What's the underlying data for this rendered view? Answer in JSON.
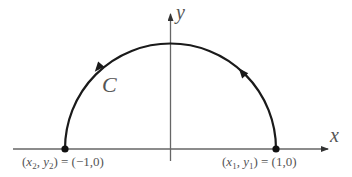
{
  "diagram": {
    "axes": {
      "x_label": "x",
      "y_label": "y"
    },
    "curve": {
      "label": "C",
      "type": "upper semicircle",
      "direction": "counterclockwise"
    },
    "points": [
      {
        "name": "(x1, y1)",
        "label_lhs_var1": "x",
        "label_lhs_sub1": "1",
        "label_lhs_var2": "y",
        "label_lhs_sub2": "1",
        "value": "= (1,0)"
      },
      {
        "name": "(x2, y2)",
        "label_lhs_var1": "x",
        "label_lhs_sub1": "2",
        "label_lhs_var2": "y",
        "label_lhs_sub2": "2",
        "value": "= (−1,0)"
      }
    ],
    "colors": {
      "curve": "#1a1a1a",
      "axis": "#555555",
      "text": "#555555"
    }
  }
}
